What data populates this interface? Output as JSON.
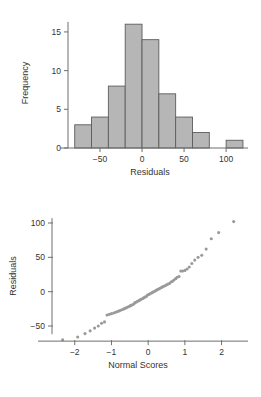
{
  "page": {
    "background": "#ffffff",
    "ink": "#333333",
    "bar_fill": "#b6b6b6",
    "bar_stroke": "#5c5c5c",
    "point_color": "#9a9a9a"
  },
  "chart_data": [
    {
      "type": "bar",
      "id": "residual-histogram",
      "title": "",
      "xlabel": "Residuals",
      "ylabel": "Frequency",
      "xlim": [
        -88,
        126
      ],
      "ylim": [
        0,
        16.8
      ],
      "grid": false,
      "legend": null,
      "xticks": [
        -50,
        0,
        50,
        100
      ],
      "xticklabels": [
        "−50",
        "0",
        "50",
        "100"
      ],
      "yticks": [
        0,
        5,
        10,
        15
      ],
      "yticklabels": [
        "0",
        "5",
        "10",
        "15"
      ],
      "bin_edges": [
        -80,
        -60,
        -40,
        -20,
        0,
        20,
        40,
        60,
        80,
        100,
        120
      ],
      "categories": [
        "-80 to -60",
        "-60 to -40",
        "-40 to -20",
        "-20 to 0",
        "0 to 20",
        "20 to 40",
        "40 to 60",
        "60 to 80",
        "80 to 100",
        "100 to 120"
      ],
      "values": [
        3,
        4,
        8,
        16,
        14,
        7,
        4,
        2,
        0,
        1
      ]
    },
    {
      "type": "scatter",
      "id": "normal-probability-plot",
      "title": "",
      "xlabel": "Normal Scores",
      "ylabel": "Residuals",
      "xlim": [
        -2.62,
        2.72
      ],
      "ylim": [
        -82,
        116
      ],
      "grid": false,
      "legend": null,
      "xticks": [
        -2,
        -1,
        0,
        1,
        2
      ],
      "xticklabels": [
        "−2",
        "−1",
        "0",
        "1",
        "2"
      ],
      "yticks": [
        -50,
        0,
        50,
        100
      ],
      "yticklabels": [
        "−50",
        "0",
        "50",
        "100"
      ],
      "x": [
        -2.33,
        -1.92,
        -1.72,
        -1.58,
        -1.46,
        -1.36,
        -1.27,
        -1.19,
        -1.12,
        -1.06,
        -1.0,
        -0.94,
        -0.89,
        -0.84,
        -0.79,
        -0.75,
        -0.7,
        -0.66,
        -0.62,
        -0.58,
        -0.54,
        -0.5,
        -0.47,
        -0.43,
        -0.39,
        -0.36,
        -0.32,
        -0.29,
        -0.25,
        -0.22,
        -0.19,
        -0.15,
        -0.12,
        -0.09,
        -0.05,
        -0.02,
        0.02,
        0.05,
        0.09,
        0.12,
        0.15,
        0.19,
        0.22,
        0.25,
        0.29,
        0.32,
        0.36,
        0.39,
        0.43,
        0.47,
        0.5,
        0.54,
        0.58,
        0.62,
        0.66,
        0.7,
        0.75,
        0.79,
        0.84,
        0.89,
        0.94,
        1.0,
        1.06,
        1.12,
        1.19,
        1.27,
        1.36,
        1.46,
        1.58,
        1.72,
        1.92,
        2.33
      ],
      "y": [
        -70,
        -66,
        -61,
        -57,
        -53,
        -50,
        -46,
        -44,
        -34,
        -33,
        -32,
        -31,
        -30,
        -29,
        -28,
        -27,
        -26,
        -25,
        -24,
        -23,
        -22,
        -21,
        -20,
        -19,
        -18,
        -16,
        -15,
        -14,
        -13,
        -12,
        -11,
        -10,
        -9,
        -8,
        -7,
        -5,
        -4,
        -3,
        -2,
        -1,
        0,
        1,
        2,
        3,
        4,
        5,
        6,
        7,
        8,
        9,
        10,
        11,
        12,
        14,
        15,
        17,
        19,
        21,
        22,
        30,
        30,
        31,
        33,
        36,
        41,
        46,
        50,
        53,
        62,
        77,
        86,
        102
      ]
    }
  ]
}
